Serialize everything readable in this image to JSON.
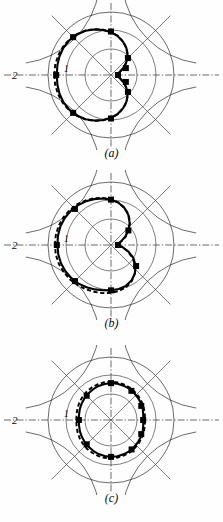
{
  "figure": {
    "kind": "polar-radiation-pattern-figure",
    "panel_count": 3,
    "axis_labels": {
      "outer": "2",
      "inner": "1"
    },
    "captions": [
      "(a)",
      "(b)",
      "(c)"
    ],
    "colors": {
      "ink": "#000000",
      "grid": "#2b2b2b",
      "background": "#ffffff"
    },
    "legend_note": "solid curve = computed, dashed curve = reference, filled squares = measured points"
  },
  "chart_data": [
    {
      "type": "line",
      "subtype": "polar",
      "title": "(a)",
      "xlabel": "",
      "ylabel": "",
      "grid": true,
      "legend_position": "none",
      "radial_ticks": [
        1,
        2
      ],
      "radial_tick_labels": [
        "1",
        "2"
      ],
      "rlim": [
        0,
        2
      ],
      "angular_ticks_deg": [
        0,
        45,
        90,
        135,
        180,
        225,
        270,
        315
      ],
      "series": [
        {
          "name": "solid",
          "style": "solid",
          "theta_deg": [
            180,
            170,
            160,
            150,
            140,
            130,
            120,
            110,
            100,
            90,
            80,
            70,
            60,
            50,
            40,
            30,
            20,
            10,
            0,
            350,
            340,
            330,
            320,
            310,
            300,
            290,
            280,
            270,
            260,
            250,
            240,
            230,
            220,
            210,
            200,
            190,
            180
          ],
          "r": [
            1.72,
            1.73,
            1.74,
            1.74,
            1.72,
            1.68,
            1.62,
            1.54,
            1.45,
            1.36,
            1.25,
            1.12,
            0.98,
            0.82,
            0.64,
            0.46,
            0.3,
            0.2,
            0.22,
            0.2,
            0.3,
            0.46,
            0.64,
            0.82,
            0.98,
            1.12,
            1.25,
            1.36,
            1.45,
            1.54,
            1.62,
            1.68,
            1.72,
            1.74,
            1.74,
            1.73,
            1.72
          ]
        },
        {
          "name": "dashed",
          "style": "dashed",
          "theta_deg": [
            180,
            170,
            160,
            150,
            140,
            130,
            120,
            110,
            100,
            90,
            80,
            70,
            60,
            50,
            40,
            30,
            20,
            10,
            0,
            350,
            340,
            330,
            320,
            310,
            300,
            290,
            280,
            270,
            260,
            250,
            240,
            230,
            220,
            210,
            200,
            190,
            180
          ],
          "r": [
            1.8,
            1.8,
            1.79,
            1.77,
            1.74,
            1.69,
            1.63,
            1.55,
            1.46,
            1.37,
            1.26,
            1.13,
            0.99,
            0.83,
            0.65,
            0.47,
            0.31,
            0.21,
            0.18,
            0.21,
            0.31,
            0.47,
            0.65,
            0.83,
            0.99,
            1.13,
            1.26,
            1.37,
            1.46,
            1.55,
            1.63,
            1.69,
            1.74,
            1.77,
            1.79,
            1.8,
            1.8
          ]
        },
        {
          "name": "measured",
          "style": "squares",
          "theta_deg": [
            180,
            135,
            90,
            45,
            25,
            0,
            335,
            315,
            270,
            225
          ],
          "r": [
            1.74,
            1.7,
            1.38,
            0.76,
            0.52,
            0.22,
            0.52,
            0.76,
            1.38,
            1.7
          ]
        }
      ]
    },
    {
      "type": "line",
      "subtype": "polar",
      "title": "(b)",
      "xlabel": "",
      "ylabel": "",
      "grid": true,
      "legend_position": "none",
      "radial_ticks": [
        1,
        2
      ],
      "radial_tick_labels": [
        "1",
        "2"
      ],
      "rlim": [
        0,
        2
      ],
      "angular_ticks_deg": [
        0,
        45,
        90,
        135,
        180,
        225,
        270,
        315
      ],
      "series": [
        {
          "name": "solid",
          "style": "solid",
          "theta_deg": [
            180,
            170,
            160,
            150,
            140,
            130,
            120,
            110,
            100,
            90,
            80,
            70,
            60,
            50,
            40,
            30,
            20,
            10,
            0,
            350,
            340,
            330,
            320,
            310,
            300,
            290,
            280,
            270,
            260,
            250,
            240,
            230,
            220,
            210,
            200,
            190,
            180
          ],
          "r": [
            1.7,
            1.71,
            1.71,
            1.7,
            1.68,
            1.64,
            1.6,
            1.55,
            1.5,
            1.44,
            1.36,
            1.25,
            1.1,
            0.92,
            0.72,
            0.52,
            0.34,
            0.22,
            0.2,
            0.36,
            0.58,
            0.82,
            1.02,
            1.18,
            1.3,
            1.38,
            1.42,
            1.44,
            1.46,
            1.5,
            1.55,
            1.6,
            1.64,
            1.67,
            1.69,
            1.7,
            1.7
          ]
        },
        {
          "name": "dashed",
          "style": "dashed",
          "theta_deg": [
            180,
            170,
            160,
            150,
            140,
            130,
            120,
            110,
            100,
            90,
            80,
            70,
            60,
            50,
            40,
            30,
            20,
            10,
            0,
            350,
            340,
            330,
            320,
            310,
            300,
            290,
            280,
            270,
            260,
            250,
            240,
            230,
            220,
            210,
            200,
            190,
            180
          ],
          "r": [
            1.78,
            1.78,
            1.77,
            1.75,
            1.72,
            1.68,
            1.63,
            1.58,
            1.52,
            1.46,
            1.37,
            1.26,
            1.12,
            0.94,
            0.74,
            0.54,
            0.36,
            0.24,
            0.22,
            0.34,
            0.54,
            0.78,
            1.0,
            1.18,
            1.32,
            1.42,
            1.48,
            1.52,
            1.55,
            1.58,
            1.62,
            1.66,
            1.7,
            1.73,
            1.76,
            1.78,
            1.78
          ]
        },
        {
          "name": "measured",
          "style": "squares",
          "theta_deg": [
            180,
            135,
            90,
            40,
            0,
            320,
            270,
            225
          ],
          "r": [
            1.72,
            1.62,
            1.44,
            0.72,
            0.22,
            1.04,
            1.44,
            1.62
          ]
        }
      ]
    },
    {
      "type": "line",
      "subtype": "polar",
      "title": "(c)",
      "xlabel": "",
      "ylabel": "",
      "grid": true,
      "legend_position": "none",
      "radial_ticks": [
        1,
        2
      ],
      "radial_tick_labels": [
        "1",
        "2"
      ],
      "rlim": [
        0,
        2
      ],
      "angular_ticks_deg": [
        0,
        45,
        90,
        135,
        180,
        225,
        270,
        315
      ],
      "series": [
        {
          "name": "solid",
          "style": "solid",
          "theta_deg": [
            180,
            170,
            160,
            150,
            140,
            130,
            120,
            110,
            100,
            90,
            80,
            70,
            60,
            50,
            40,
            30,
            20,
            10,
            0,
            350,
            340,
            330,
            320,
            310,
            300,
            290,
            280,
            270,
            260,
            250,
            240,
            230,
            220,
            210,
            200,
            190,
            180
          ],
          "r": [
            1.02,
            1.03,
            1.05,
            1.07,
            1.09,
            1.11,
            1.13,
            1.15,
            1.16,
            1.17,
            1.17,
            1.16,
            1.15,
            1.13,
            1.11,
            1.09,
            1.07,
            1.04,
            1.02,
            1.04,
            1.07,
            1.09,
            1.11,
            1.13,
            1.15,
            1.16,
            1.17,
            1.17,
            1.16,
            1.15,
            1.13,
            1.11,
            1.09,
            1.07,
            1.05,
            1.03,
            1.02
          ]
        },
        {
          "name": "dashed",
          "style": "dashed",
          "theta_deg": [
            180,
            170,
            160,
            150,
            140,
            130,
            120,
            110,
            100,
            90,
            80,
            70,
            60,
            50,
            40,
            30,
            20,
            10,
            0,
            350,
            340,
            330,
            320,
            310,
            300,
            290,
            280,
            270,
            260,
            250,
            240,
            230,
            220,
            210,
            200,
            190,
            180
          ],
          "r": [
            1.1,
            1.11,
            1.13,
            1.15,
            1.17,
            1.19,
            1.2,
            1.21,
            1.22,
            1.22,
            1.21,
            1.2,
            1.19,
            1.17,
            1.15,
            1.13,
            1.11,
            1.09,
            1.08,
            1.09,
            1.11,
            1.13,
            1.15,
            1.17,
            1.19,
            1.2,
            1.21,
            1.22,
            1.22,
            1.21,
            1.2,
            1.19,
            1.17,
            1.15,
            1.13,
            1.11,
            1.1
          ]
        },
        {
          "name": "measured",
          "style": "squares",
          "theta_deg": [
            180,
            135,
            90,
            55,
            25,
            0,
            335,
            305,
            270,
            225
          ],
          "r": [
            1.02,
            1.09,
            1.17,
            1.13,
            1.06,
            1.02,
            1.06,
            1.14,
            1.17,
            1.09
          ]
        }
      ]
    }
  ]
}
